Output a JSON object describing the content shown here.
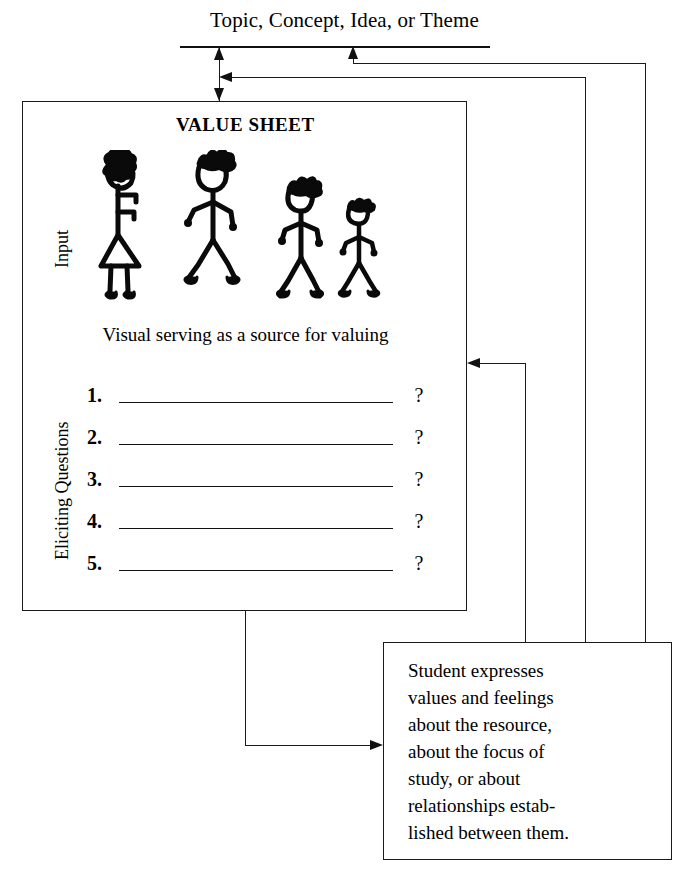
{
  "diagram": {
    "title": "Topic, Concept, Idea, or Theme",
    "value_sheet": {
      "heading": "VALUE SHEET",
      "visual_caption": "Visual serving as a source for valuing",
      "side_labels": {
        "input": "Input",
        "eliciting": "Eliciting Questions"
      },
      "figures_alt": "four hand-drawn stick figures",
      "questions": [
        {
          "number": "1.",
          "text": "",
          "mark": "?"
        },
        {
          "number": "2.",
          "text": "",
          "mark": "?"
        },
        {
          "number": "3.",
          "text": "",
          "mark": "?"
        },
        {
          "number": "4.",
          "text": "",
          "mark": "?"
        },
        {
          "number": "5.",
          "text": "",
          "mark": "?"
        }
      ]
    },
    "output_box": {
      "lines": [
        "Student expresses",
        "values and feelings",
        "about the resource,",
        "about the focus of",
        "study, or about",
        "relationships estab-",
        "lished between them."
      ]
    },
    "colors": {
      "ink": "#1a1a1a",
      "paper": "#ffffff"
    }
  }
}
